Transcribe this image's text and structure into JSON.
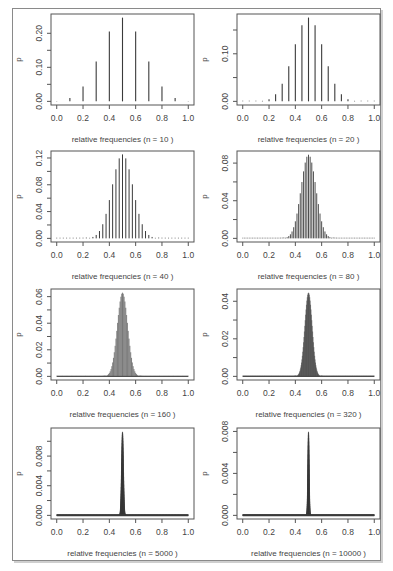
{
  "figure": {
    "layout": {
      "rows": 4,
      "cols": 2
    },
    "colors": {
      "bar": "#3a3a3a",
      "axis": "#555555",
      "frame": "#8a8a8a"
    }
  },
  "chart_data": [
    {
      "type": "bar",
      "title": "",
      "xlabel": "relative frequencies (n = 10 )",
      "ylabel": "p",
      "n": 10,
      "success_prob": 0.5,
      "xlim": [
        0,
        1
      ],
      "ylim": [
        0,
        0.246
      ],
      "xticks": [
        "0.0",
        "0.2",
        "0.4",
        "0.6",
        "0.8",
        "1.0"
      ],
      "yticks": [
        0.0,
        0.05,
        0.1,
        0.15,
        0.2
      ],
      "ytick_labels": [
        "0.00",
        "",
        "0.10",
        "",
        "0.20"
      ],
      "x": [
        0.0,
        0.1,
        0.2,
        0.3,
        0.4,
        0.5,
        0.6,
        0.7,
        0.8,
        0.9,
        1.0
      ],
      "values": [
        0.001,
        0.01,
        0.044,
        0.117,
        0.205,
        0.246,
        0.205,
        0.117,
        0.044,
        0.01,
        0.001
      ]
    },
    {
      "type": "bar",
      "xlabel": "relative frequencies (n = 20 )",
      "ylabel": "p",
      "n": 20,
      "success_prob": 0.5,
      "xlim": [
        0,
        1
      ],
      "ylim": [
        0,
        0.176
      ],
      "xticks": [
        "0.0",
        "0.2",
        "0.4",
        "0.6",
        "0.8",
        "1.0"
      ],
      "yticks": [
        0.0,
        0.05,
        0.1,
        0.15
      ],
      "ytick_labels": [
        "0.00",
        "",
        "0.10",
        ""
      ],
      "peak": 0.176
    },
    {
      "type": "bar",
      "xlabel": "relative frequencies (n = 40 )",
      "ylabel": "p",
      "n": 40,
      "success_prob": 0.5,
      "xlim": [
        0,
        1
      ],
      "ylim": [
        0,
        0.125
      ],
      "xticks": [
        "0.0",
        "0.2",
        "0.4",
        "0.6",
        "0.8",
        "1.0"
      ],
      "yticks": [
        0.0,
        0.02,
        0.04,
        0.06,
        0.08,
        0.1,
        0.12
      ],
      "ytick_labels": [
        "0.00",
        "",
        "0.04",
        "",
        "0.08",
        "",
        "0.12"
      ],
      "peak": 0.125
    },
    {
      "type": "bar",
      "xlabel": "relative frequencies (n = 80 )",
      "ylabel": "p",
      "n": 80,
      "success_prob": 0.5,
      "xlim": [
        0,
        1
      ],
      "ylim": [
        0,
        0.089
      ],
      "xticks": [
        "0.0",
        "0.2",
        "0.4",
        "0.6",
        "0.8",
        "1.0"
      ],
      "yticks": [
        0.0,
        0.02,
        0.04,
        0.06,
        0.08
      ],
      "ytick_labels": [
        "0.00",
        "",
        "0.04",
        "",
        "0.08"
      ],
      "peak": 0.089
    },
    {
      "type": "bar",
      "xlabel": "relative frequencies (n = 160 )",
      "ylabel": "p",
      "n": 160,
      "success_prob": 0.5,
      "xlim": [
        0,
        1
      ],
      "ylim": [
        0,
        0.063
      ],
      "xticks": [
        "0.0",
        "0.2",
        "0.4",
        "0.6",
        "0.8",
        "1.0"
      ],
      "yticks": [
        0.0,
        0.01,
        0.02,
        0.03,
        0.04,
        0.05,
        0.06
      ],
      "ytick_labels": [
        "0.00",
        "",
        "0.02",
        "",
        "0.04",
        "",
        "0.06"
      ],
      "peak": 0.063
    },
    {
      "type": "bar",
      "xlabel": "relative frequencies (n = 320 )",
      "ylabel": "p",
      "n": 320,
      "success_prob": 0.5,
      "xlim": [
        0,
        1
      ],
      "ylim": [
        0,
        0.0446
      ],
      "xticks": [
        "0.0",
        "0.2",
        "0.4",
        "0.6",
        "0.8",
        "1.0"
      ],
      "yticks": [
        0.0,
        0.01,
        0.02,
        0.03,
        0.04
      ],
      "ytick_labels": [
        "0.00",
        "",
        "0.02",
        "",
        "0.04"
      ],
      "peak": 0.0446
    },
    {
      "type": "bar",
      "xlabel": "relative frequencies (n = 5000 )",
      "ylabel": "p",
      "n": 5000,
      "success_prob": 0.5,
      "xlim": [
        0,
        1
      ],
      "ylim": [
        0,
        0.0113
      ],
      "xticks": [
        "0.0",
        "0.2",
        "0.4",
        "0.6",
        "0.8",
        "1.0"
      ],
      "yticks": [
        0.0,
        0.002,
        0.004,
        0.006,
        0.008,
        0.01
      ],
      "ytick_labels": [
        "0.000",
        "",
        "0.004",
        "",
        "0.008",
        ""
      ],
      "peak": 0.0113
    },
    {
      "type": "bar",
      "xlabel": "relative frequencies (n = 10000 )",
      "ylabel": "p",
      "n": 10000,
      "success_prob": 0.5,
      "xlim": [
        0,
        1
      ],
      "ylim": [
        0,
        0.00798
      ],
      "xticks": [
        "0.0",
        "0.2",
        "0.4",
        "0.6",
        "0.8",
        "1.0"
      ],
      "yticks": [
        0.0,
        0.002,
        0.004,
        0.006,
        0.008
      ],
      "ytick_labels": [
        "0.000",
        "",
        "0.004",
        "",
        "0.008"
      ],
      "peak": 0.00798
    }
  ]
}
